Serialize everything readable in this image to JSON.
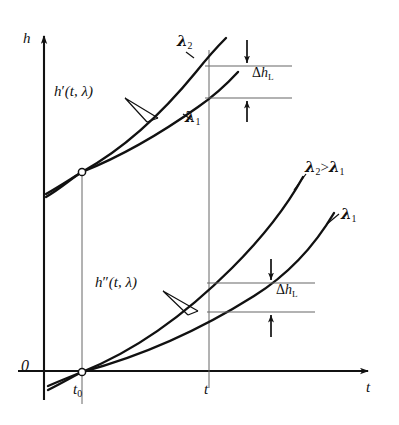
{
  "figure": {
    "type": "line-diagram",
    "background": "#ffffff",
    "ink_color": "#111111",
    "thin_color": "#555555"
  },
  "axes": {
    "y_label": "h",
    "x_label": "t",
    "origin_label": "0",
    "x_ticks": [
      {
        "id": "t0",
        "base": "t",
        "sub": "0",
        "x": 82
      },
      {
        "id": "t",
        "base": "t",
        "sub": "",
        "x": 209
      }
    ],
    "x_axis_y": 371,
    "y_axis_x": 44,
    "grid": "none",
    "arrows": "both-axes"
  },
  "labels": {
    "upper_function": {
      "base": "h",
      "prime": "′",
      "args": "(t, λ)"
    },
    "lower_function": {
      "base": "h",
      "prime": "″",
      "args": "(t, λ)"
    },
    "upper_lambda2": {
      "base": "λ",
      "sub": "2"
    },
    "upper_lambda1": {
      "base": "λ",
      "sub": "1"
    },
    "lower_lambda1": {
      "base": "λ",
      "sub": "1"
    },
    "inequality": {
      "left": "λ",
      "left_sub": "2",
      "op": ">",
      "right": "λ",
      "right_sub": "1"
    },
    "delta_top": {
      "delta": "Δ",
      "base": "h",
      "sub": "L"
    },
    "delta_bottom": {
      "delta": "Δ",
      "base": "h",
      "sub": "L"
    }
  },
  "chart_data": {
    "type": "line",
    "title": "",
    "xlabel": "t",
    "ylabel": "h",
    "xlim": [
      44,
      380
    ],
    "ylim": [
      371,
      30
    ],
    "grid": false,
    "legend": "inline-curve-labels",
    "annotations": [
      {
        "text": "h′(t, λ)",
        "x": 58,
        "y": 92,
        "kind": "leader-label"
      },
      {
        "text": "h″(t, λ)",
        "x": 98,
        "y": 282,
        "kind": "leader-label"
      },
      {
        "text": "λ₂",
        "x": 180,
        "y": 38,
        "kind": "curve-label"
      },
      {
        "text": "λ₁",
        "x": 186,
        "y": 113,
        "kind": "curve-label"
      },
      {
        "text": "λ₂ > λ₁",
        "x": 305,
        "y": 163,
        "kind": "note"
      },
      {
        "text": "λ₁",
        "x": 341,
        "y": 211,
        "kind": "curve-label"
      },
      {
        "text": "Δhₗ",
        "x": 252,
        "y": 70,
        "kind": "dimension"
      },
      {
        "text": "Δhₗ",
        "x": 276,
        "y": 287,
        "kind": "dimension"
      }
    ],
    "series": [
      {
        "name": "h'(t, lambda2)",
        "group": "upper",
        "lambda": "lambda2",
        "path": "M 46 193 L 82 172 C 130 148 175 108 228 43",
        "points_px": [
          [
            46,
            193
          ],
          [
            82,
            172
          ],
          [
            140,
            141
          ],
          [
            190,
            94
          ],
          [
            228,
            43
          ]
        ]
      },
      {
        "name": "h'(t, lambda1)",
        "group": "upper",
        "lambda": "lambda1",
        "path": "M 46 196 L 82 172 C 135 152 190 117 236 74",
        "points_px": [
          [
            46,
            196
          ],
          [
            82,
            172
          ],
          [
            140,
            147
          ],
          [
            190,
            117
          ],
          [
            236,
            74
          ]
        ]
      },
      {
        "name": "h''(t, lambda2)",
        "group": "lower",
        "lambda": "lambda2",
        "path": "M 48 385 L 82 372 C 150 345 215 290 302 176",
        "points_px": [
          [
            48,
            385
          ],
          [
            82,
            372
          ],
          [
            160,
            337
          ],
          [
            240,
            268
          ],
          [
            302,
            176
          ]
        ]
      },
      {
        "name": "h''(t, lambda1)",
        "group": "lower",
        "lambda": "lambda1",
        "path": "M 48 389 L 82 372 C 150 352 230 305 332 214",
        "points_px": [
          [
            48,
            389
          ],
          [
            82,
            372
          ],
          [
            170,
            344
          ],
          [
            260,
            288
          ],
          [
            332,
            214
          ]
        ]
      }
    ],
    "markers": [
      {
        "name": "upper-crossing",
        "x": 82,
        "y": 172,
        "style": "open-circle"
      },
      {
        "name": "origin-crossing",
        "x": 82,
        "y": 372,
        "style": "open-circle"
      }
    ],
    "dimensions": [
      {
        "name": "delta-h-L-upper",
        "x_arrow": 247,
        "y_top": 66,
        "y_bottom": 98,
        "line_x_start": 205,
        "line_x_end": 292
      },
      {
        "name": "delta-h-L-lower",
        "x_arrow": 271,
        "y_top": 283,
        "y_bottom": 312,
        "line_x_start": 207,
        "line_x_end": 315
      }
    ],
    "verticals": [
      {
        "name": "vline-t0",
        "x": 82,
        "y_top": 172,
        "y_bottom": 400
      },
      {
        "name": "vline-t",
        "x": 209,
        "y_top": 50,
        "y_bottom": 385
      }
    ]
  }
}
